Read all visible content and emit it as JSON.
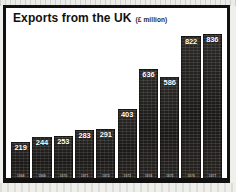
{
  "figure": {
    "title": "Exports from the UK",
    "subtitle": "(£ million)"
  },
  "chart_data": {
    "type": "bar",
    "title": "Exports from the UK",
    "subtitle": "(£ million)",
    "xlabel": "",
    "ylabel": "£ million",
    "ylim": [
      0,
      880
    ],
    "grid": false,
    "legend": "none",
    "bar_color": "#231f1d",
    "label_color": "#ffffff",
    "categories": [
      "1968",
      "1969",
      "1970",
      "1971",
      "1972",
      "1973",
      "1974",
      "1975",
      "1976",
      "1977"
    ],
    "values": [
      219,
      244,
      253,
      283,
      291,
      403,
      636,
      586,
      822,
      836
    ],
    "data_labels": [
      "219",
      "244",
      "253",
      "283",
      "291",
      "403",
      "636",
      "586",
      "822",
      "836"
    ]
  }
}
